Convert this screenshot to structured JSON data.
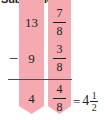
{
  "heading": {
    "text": "Subtraction"
  },
  "problem": {
    "operation_symbol": "−",
    "minuend": {
      "whole": "13",
      "numerator": "7",
      "denominator": "8"
    },
    "subtrahend": {
      "whole": "9",
      "numerator": "3",
      "denominator": "8"
    },
    "difference": {
      "whole": "4",
      "numerator": "4",
      "denominator": "8"
    },
    "simplified": {
      "equals_symbol": "=",
      "whole": "4",
      "numerator": "1",
      "denominator": "2"
    }
  },
  "highlights": {
    "color": "#f4aab0",
    "whole_column_label": "whole-number column",
    "fraction_column_label": "fraction column"
  },
  "colors": {
    "ink": "#231f20",
    "rule": "#4b4b4f",
    "highlight": "#f4aab0",
    "background": "#ffffff"
  }
}
